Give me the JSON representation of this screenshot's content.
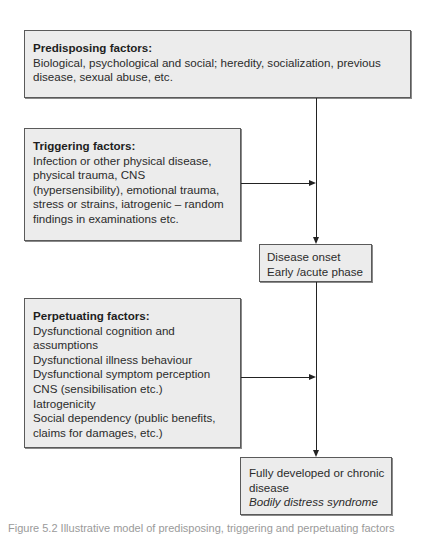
{
  "diagram": {
    "nodes": {
      "predisposing": {
        "title": "Predisposing factors:",
        "lines": [
          "Biological, psychological and social; heredity, socialization, previous",
          "disease, sexual abuse, etc."
        ]
      },
      "triggering": {
        "title": "Triggering factors:",
        "lines": [
          "Infection or other physical disease,",
          "physical trauma, CNS",
          "(hypersensibility), emotional trauma,",
          "stress or strains, iatrogenic – random",
          "findings in examinations etc."
        ]
      },
      "onset": {
        "lines": [
          "Disease onset",
          "Early /acute phase"
        ]
      },
      "perpetuating": {
        "title": "Perpetuating factors:",
        "lines": [
          "Dysfunctional cognition and",
          "assumptions",
          "Dysfunctional illness behaviour",
          "Dysfunctional symptom perception",
          "CNS (sensibilisation etc.)",
          "Iatrogenicity",
          "Social dependency (public benefits,",
          "claims for damages, etc.)"
        ]
      },
      "final": {
        "lines": [
          "Fully developed or chronic",
          "disease"
        ],
        "italic_line": "Bodily distress syndrome"
      }
    },
    "edges": [
      {
        "from": "predisposing",
        "to": "onset"
      },
      {
        "from": "triggering",
        "to": "main-flow"
      },
      {
        "from": "onset",
        "to": "final"
      },
      {
        "from": "perpetuating",
        "to": "main-flow"
      }
    ],
    "caption": "Figure 5.2 Illustrative model of predisposing, triggering and perpetuating factors"
  }
}
